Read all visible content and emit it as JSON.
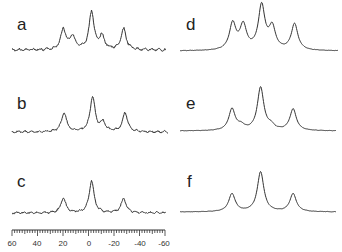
{
  "figure": {
    "panels": [
      {
        "label": "a",
        "column": "left"
      },
      {
        "label": "b",
        "column": "left"
      },
      {
        "label": "c",
        "column": "left"
      },
      {
        "label": "d",
        "column": "right"
      },
      {
        "label": "e",
        "column": "right"
      },
      {
        "label": "f",
        "column": "right"
      }
    ],
    "axis": {
      "ticks": [
        "60",
        "40",
        "20",
        "0",
        "-20",
        "-40",
        "-60"
      ],
      "range": [
        60,
        -60
      ]
    },
    "line_color": "#333333"
  },
  "chart_data": {
    "type": "line",
    "title": "",
    "xlabel": "",
    "ylabel": "",
    "xlim": [
      60,
      -60
    ],
    "x_ticks": [
      60,
      40,
      20,
      0,
      -20,
      -40,
      -60
    ],
    "grid": false,
    "series": [
      {
        "name": "a",
        "peaks": [
          {
            "x": 20,
            "h": 0.55
          },
          {
            "x": 13,
            "h": 0.35
          },
          {
            "x": -2,
            "h": 1.0
          },
          {
            "x": -10,
            "h": 0.35
          },
          {
            "x": -27,
            "h": 0.55
          }
        ]
      },
      {
        "name": "b",
        "peaks": [
          {
            "x": 20,
            "h": 0.55
          },
          {
            "x": -2,
            "h": 1.0
          },
          {
            "x": -10,
            "h": 0.25
          },
          {
            "x": -27,
            "h": 0.55
          }
        ]
      },
      {
        "name": "c",
        "peaks": [
          {
            "x": 20,
            "h": 0.45
          },
          {
            "x": -2,
            "h": 1.0
          },
          {
            "x": -27,
            "h": 0.45
          }
        ]
      },
      {
        "name": "d",
        "peaks": [
          {
            "x": 20,
            "h": 0.6
          },
          {
            "x": 12,
            "h": 0.55
          },
          {
            "x": -2,
            "h": 1.0
          },
          {
            "x": -10,
            "h": 0.5
          },
          {
            "x": -27,
            "h": 0.6
          }
        ]
      },
      {
        "name": "e",
        "peaks": [
          {
            "x": 20,
            "h": 0.5
          },
          {
            "x": 13,
            "h": 0.1
          },
          {
            "x": -2,
            "h": 1.0
          },
          {
            "x": -10,
            "h": 0.1
          },
          {
            "x": -27,
            "h": 0.5
          }
        ]
      },
      {
        "name": "f",
        "peaks": [
          {
            "x": 20,
            "h": 0.45
          },
          {
            "x": -2,
            "h": 1.0
          },
          {
            "x": -27,
            "h": 0.45
          }
        ]
      }
    ]
  }
}
